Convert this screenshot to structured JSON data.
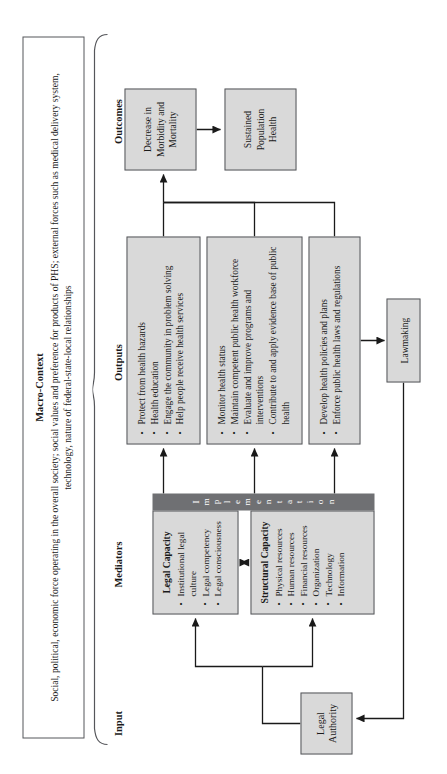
{
  "macro": {
    "title": "Macro-Context",
    "text": "Social, political, economic force operating in the overall society; social values and preference for products of PHS; external forces such as medical delivery system, technology, nature of federal-state-local relationships"
  },
  "columns": {
    "input": "Input",
    "mediators": "Mediators",
    "outputs": "Outputs",
    "outcomes": "Outcomes"
  },
  "input": {
    "legal_authority": "Legal\nAuthority"
  },
  "mediators": {
    "legal_capacity": {
      "title": "Legal Capacity",
      "items": [
        "Institutional legal culture",
        "Legal competency",
        "Legal consciousness"
      ]
    },
    "structural_capacity": {
      "title": "Structural Capacity",
      "items": [
        "Physical resources",
        "Human resources",
        "Financial resources",
        "Organization",
        "Technology",
        "Information"
      ]
    },
    "implementation_band": "Implementation"
  },
  "outputs": {
    "group1": [
      "Protect from health hazards",
      "Health education",
      "Engage the community in problem solving",
      "Help people receive health services"
    ],
    "group2": [
      "Monitor health status",
      "Maintain competent public health workforce",
      "Evaluate and improve programs and interventions",
      "Contribute to and apply evidence base of public health"
    ],
    "group3": [
      "Develop health policies and plans",
      "Enforce public health laws and regulations"
    ],
    "lawmaking": "Lawmaking"
  },
  "outcomes": {
    "decrease": "Decrease in\nMorbidity and\nMortality",
    "sustained": "Sustained\nPopulation\nHealth"
  },
  "colors": {
    "box_fill": "#d9d9d9",
    "box_border": "#55565a",
    "band_fill": "#6f7073",
    "band_text": "#ffffff",
    "page_bg": "#ffffff",
    "ink": "#1a1a1a"
  }
}
